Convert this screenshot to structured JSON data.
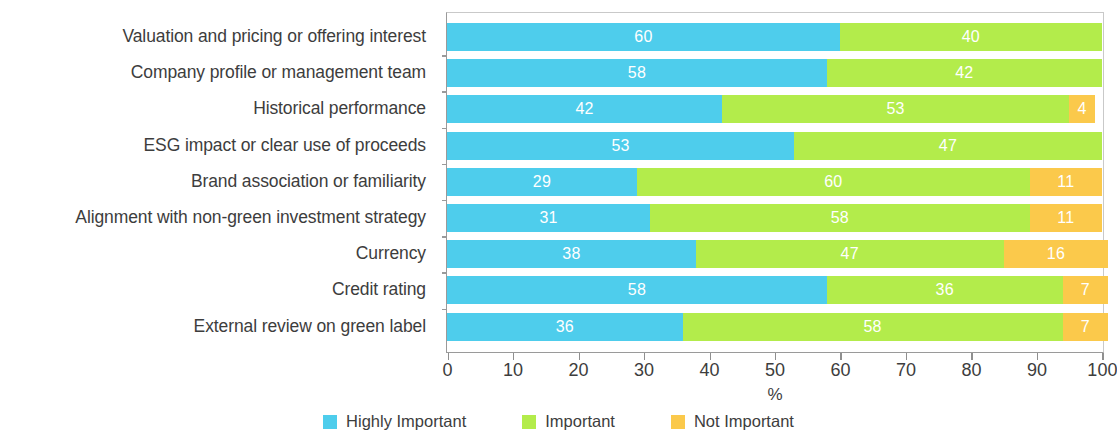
{
  "chart_data": {
    "type": "bar",
    "subtype": "stacked-horizontal-100pct",
    "title": "",
    "xlabel": "%",
    "ylabel": "",
    "xlim": [
      0,
      100
    ],
    "xticks": [
      0,
      10,
      20,
      30,
      40,
      50,
      60,
      70,
      80,
      90,
      100
    ],
    "xtick_labels": [
      "0",
      "10",
      "20",
      "30",
      "40",
      "50",
      "60",
      "70",
      "80",
      "90",
      "100"
    ],
    "grid": false,
    "legend_position": "bottom-center",
    "categories": [
      "Valuation and pricing or offering interest",
      "Company profile or management team",
      "Historical performance",
      "ESG impact or clear use of proceeds",
      "Brand association or familiarity",
      "Alignment with non-green investment strategy",
      "Currency",
      "Credit rating",
      "External review on green label"
    ],
    "series": [
      {
        "name": "Highly Important",
        "color": "#4ECDEC",
        "values": [
          60,
          58,
          42,
          53,
          29,
          31,
          38,
          58,
          36
        ]
      },
      {
        "name": "Important",
        "color": "#B3EC4B",
        "values": [
          40,
          42,
          53,
          47,
          60,
          58,
          47,
          36,
          58
        ]
      },
      {
        "name": "Not Important",
        "color": "#FBC94B",
        "values": [
          0,
          0,
          4,
          0,
          11,
          11,
          16,
          7,
          7
        ]
      }
    ],
    "bar_labels": [
      [
        "60",
        "40",
        ""
      ],
      [
        "58",
        "42",
        ""
      ],
      [
        "42",
        "53",
        "4"
      ],
      [
        "53",
        "47",
        ""
      ],
      [
        "29",
        "60",
        "11"
      ],
      [
        "31",
        "58",
        "11"
      ],
      [
        "38",
        "47",
        "16"
      ],
      [
        "58",
        "36",
        "7"
      ],
      [
        "36",
        "58",
        "7"
      ]
    ]
  },
  "legend": {
    "items": [
      {
        "label": "Highly Important",
        "color": "#4ECDEC"
      },
      {
        "label": "Important",
        "color": "#B3EC4B"
      },
      {
        "label": "Not Important",
        "color": "#FBC94B"
      }
    ]
  },
  "axis": {
    "x_title": "%"
  }
}
